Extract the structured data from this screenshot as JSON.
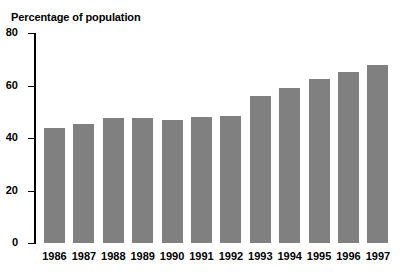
{
  "top_remnant": " ",
  "chart_data": {
    "type": "bar",
    "title": "Percentage of population",
    "xlabel": "",
    "ylabel": "Percentage of population",
    "ylim": [
      0,
      80
    ],
    "yticks": [
      0,
      20,
      40,
      60,
      80
    ],
    "grid": false,
    "legend": false,
    "bar_color": "#808080",
    "axis_color": "#000000",
    "background": "#ffffff",
    "categories": [
      "1986",
      "1987",
      "1988",
      "1989",
      "1990",
      "1991",
      "1992",
      "1993",
      "1994",
      "1995",
      "1996",
      "1997"
    ],
    "values": [
      44,
      45.5,
      47.5,
      47.5,
      47,
      48,
      48.5,
      56,
      59,
      62.5,
      65,
      68
    ]
  }
}
